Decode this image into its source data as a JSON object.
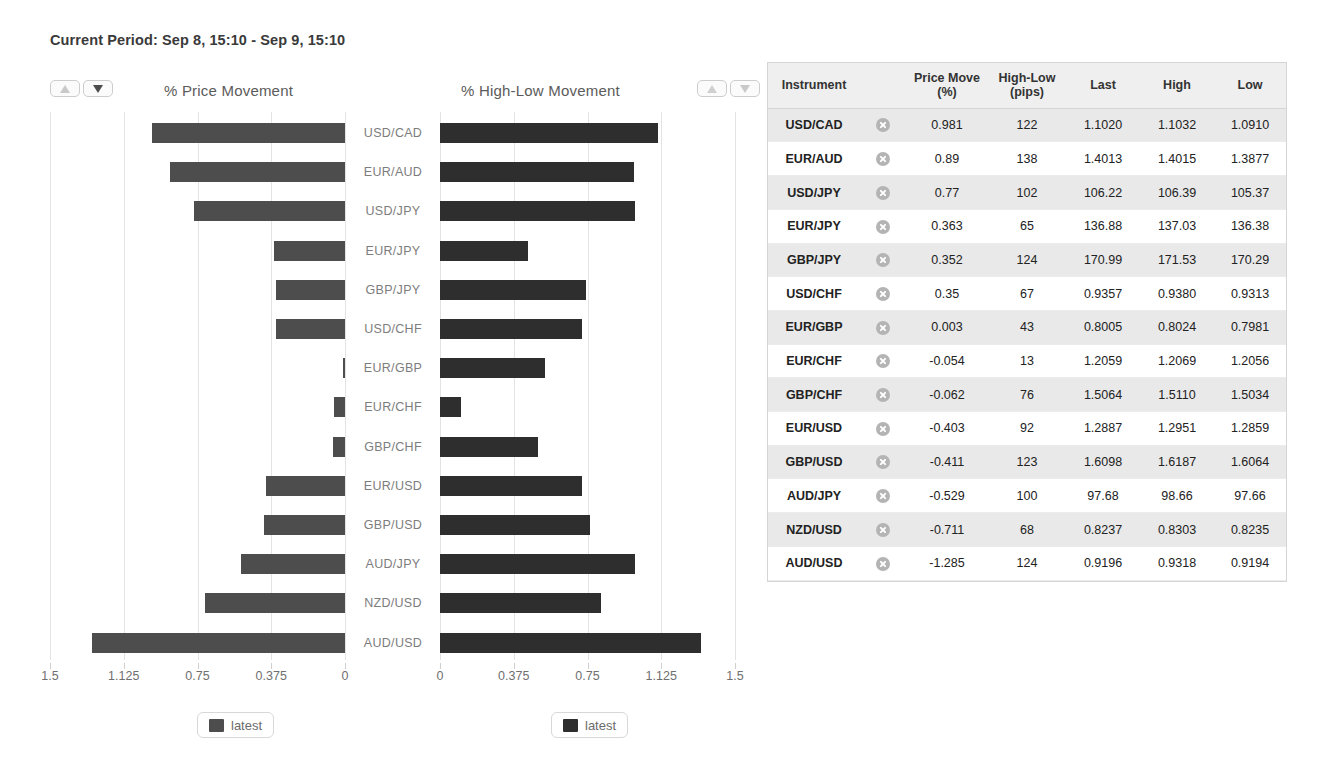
{
  "header": {
    "period_label": "Current Period:",
    "period_value": "Sep 8, 15:10 - Sep 9, 15:10"
  },
  "controls": {
    "left_sort": {
      "asc_icon": "triangle-up-icon",
      "desc_icon": "triangle-down-icon",
      "asc_color": "#c9c9c9",
      "desc_color": "#4d4d4d"
    },
    "right_sort": {
      "asc_icon": "triangle-up-icon",
      "desc_icon": "triangle-down-icon",
      "asc_color": "#cfcfcf",
      "desc_color": "#c9c9c9"
    }
  },
  "charts": {
    "left_title": "% Price Movement",
    "right_title": "% High-Low Movement",
    "left_legend": "latest",
    "right_legend": "latest",
    "bar_color_left": "#4d4d4d",
    "bar_color_right": "#2e2e2e"
  },
  "chart_data": [
    {
      "type": "bar",
      "title": "% Price Movement",
      "orientation": "horizontal",
      "direction": "right-to-left",
      "xlabel": "",
      "ylabel": "",
      "xlim": [
        0,
        1.5
      ],
      "ticks": [
        "1.5",
        "1.125",
        "0.75",
        "0.375",
        "0"
      ],
      "tick_values": [
        1.5,
        1.125,
        0.75,
        0.375,
        0
      ],
      "grid": true,
      "legend": "latest",
      "legend_position": "bottom",
      "categories": [
        "USD/CAD",
        "EUR/AUD",
        "USD/JPY",
        "EUR/JPY",
        "GBP/JPY",
        "USD/CHF",
        "EUR/GBP",
        "EUR/CHF",
        "GBP/CHF",
        "EUR/USD",
        "GBP/USD",
        "AUD/JPY",
        "NZD/USD",
        "AUD/USD"
      ],
      "values": [
        0.981,
        0.89,
        0.77,
        0.363,
        0.352,
        0.35,
        0.003,
        0.054,
        0.062,
        0.403,
        0.411,
        0.529,
        0.711,
        1.285
      ]
    },
    {
      "type": "bar",
      "title": "% High-Low Movement",
      "orientation": "horizontal",
      "direction": "left-to-right",
      "xlabel": "",
      "ylabel": "",
      "xlim": [
        0,
        1.5
      ],
      "ticks": [
        "0",
        "0.375",
        "0.75",
        "1.125",
        "1.5"
      ],
      "tick_values": [
        0,
        0.375,
        0.75,
        1.125,
        1.5
      ],
      "grid": true,
      "legend": "latest",
      "legend_position": "bottom",
      "categories": [
        "USD/CAD",
        "EUR/AUD",
        "USD/JPY",
        "EUR/JPY",
        "GBP/JPY",
        "USD/CHF",
        "EUR/GBP",
        "EUR/CHF",
        "GBP/CHF",
        "EUR/USD",
        "GBP/USD",
        "AUD/JPY",
        "NZD/USD",
        "AUD/USD"
      ],
      "values": [
        1.11,
        0.985,
        0.99,
        0.445,
        0.74,
        0.72,
        0.535,
        0.105,
        0.5,
        0.72,
        0.765,
        0.99,
        0.82,
        1.325
      ]
    }
  ],
  "table": {
    "columns": [
      "Instrument",
      "",
      "Price Move\n(%)",
      "High-Low\n(pips)",
      "Last",
      "High",
      "Low"
    ],
    "headers": {
      "instrument": "Instrument",
      "remove": "",
      "price_move_l1": "Price Move",
      "price_move_l2": "(%)",
      "high_low_l1": "High-Low",
      "high_low_l2": "(pips)",
      "last": "Last",
      "high": "High",
      "low": "Low"
    },
    "remove_icon": "close-circle-icon",
    "rows": [
      {
        "instrument": "USD/CAD",
        "price_move": "0.981",
        "high_low": "122",
        "last": "1.1020",
        "high": "1.1032",
        "low": "1.0910"
      },
      {
        "instrument": "EUR/AUD",
        "price_move": "0.89",
        "high_low": "138",
        "last": "1.4013",
        "high": "1.4015",
        "low": "1.3877"
      },
      {
        "instrument": "USD/JPY",
        "price_move": "0.77",
        "high_low": "102",
        "last": "106.22",
        "high": "106.39",
        "low": "105.37"
      },
      {
        "instrument": "EUR/JPY",
        "price_move": "0.363",
        "high_low": "65",
        "last": "136.88",
        "high": "137.03",
        "low": "136.38"
      },
      {
        "instrument": "GBP/JPY",
        "price_move": "0.352",
        "high_low": "124",
        "last": "170.99",
        "high": "171.53",
        "low": "170.29"
      },
      {
        "instrument": "USD/CHF",
        "price_move": "0.35",
        "high_low": "67",
        "last": "0.9357",
        "high": "0.9380",
        "low": "0.9313"
      },
      {
        "instrument": "EUR/GBP",
        "price_move": "0.003",
        "high_low": "43",
        "last": "0.8005",
        "high": "0.8024",
        "low": "0.7981"
      },
      {
        "instrument": "EUR/CHF",
        "price_move": "-0.054",
        "high_low": "13",
        "last": "1.2059",
        "high": "1.2069",
        "low": "1.2056"
      },
      {
        "instrument": "GBP/CHF",
        "price_move": "-0.062",
        "high_low": "76",
        "last": "1.5064",
        "high": "1.5110",
        "low": "1.5034"
      },
      {
        "instrument": "EUR/USD",
        "price_move": "-0.403",
        "high_low": "92",
        "last": "1.2887",
        "high": "1.2951",
        "low": "1.2859"
      },
      {
        "instrument": "GBP/USD",
        "price_move": "-0.411",
        "high_low": "123",
        "last": "1.6098",
        "high": "1.6187",
        "low": "1.6064"
      },
      {
        "instrument": "AUD/JPY",
        "price_move": "-0.529",
        "high_low": "100",
        "last": "97.68",
        "high": "98.66",
        "low": "97.66"
      },
      {
        "instrument": "NZD/USD",
        "price_move": "-0.711",
        "high_low": "68",
        "last": "0.8237",
        "high": "0.8303",
        "low": "0.8235"
      },
      {
        "instrument": "AUD/USD",
        "price_move": "-1.285",
        "high_low": "124",
        "last": "0.9196",
        "high": "0.9318",
        "low": "0.9194"
      }
    ]
  }
}
